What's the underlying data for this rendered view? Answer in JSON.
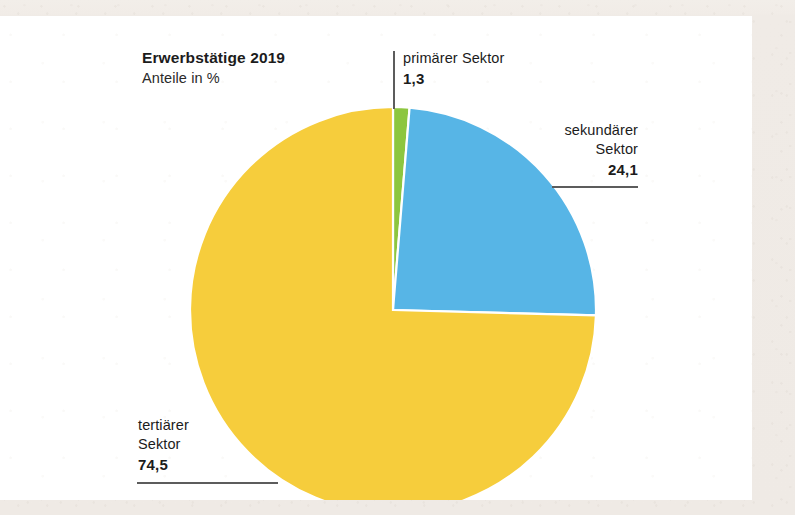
{
  "chart_data": {
    "type": "pie",
    "title": "Erwerbstätige 2019",
    "subtitle": "Anteile in %",
    "xlabel": "",
    "ylabel": "",
    "legend_position": "callout-labels",
    "grid": false,
    "unit": "%",
    "categories": [
      "primärer Sektor",
      "sekundärer Sektor",
      "tertiärer Sektor"
    ],
    "values": [
      1.3,
      24.1,
      74.5
    ],
    "value_labels": [
      "1,3",
      "24,1",
      "74,5"
    ],
    "colors": [
      "#8dc63f",
      "#57b5e6",
      "#f6cd3c"
    ],
    "start_angle_deg": 0,
    "direction": "clockwise",
    "slices": [
      {
        "name": "primärer Sektor",
        "value": 1.3,
        "label": "1,3",
        "color": "#8dc63f"
      },
      {
        "name": "sekundärer Sektor",
        "value": 24.1,
        "label": "24,1",
        "color": "#57b5e6"
      },
      {
        "name": "tertiärer Sektor",
        "value": 74.5,
        "label": "74,5",
        "color": "#f6cd3c"
      }
    ]
  },
  "header": {
    "title": "Erwerbstätige 2019",
    "subtitle": "Anteile in %"
  },
  "callouts": {
    "primary": {
      "name": "primärer Sektor",
      "value": "1,3"
    },
    "secondary_line1": "sekundärer",
    "secondary_line2": "Sektor",
    "secondary_value": "24,1",
    "tertiary_line1": "tertiärer",
    "tertiary_line2": "Sektor",
    "tertiary_value": "74,5"
  },
  "palette": {
    "green": "#8dc63f",
    "blue": "#57b5e6",
    "yellow": "#f6cd3c",
    "leader_line": "#5c5c5c",
    "text": "#1c1c1c",
    "card_bg": "#ffffff",
    "page_bg": "#efeae5"
  }
}
